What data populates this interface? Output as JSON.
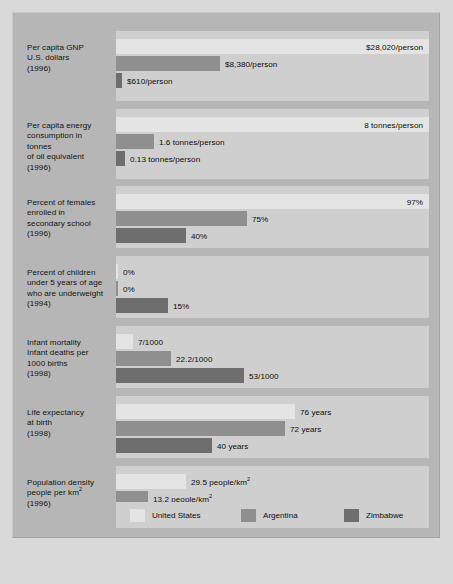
{
  "figure": {
    "bar_area_px": 313,
    "colors": {
      "united_states": "#e4e4e4",
      "argentina": "#8f8f8f",
      "zimbabwe": "#6e6e6e",
      "panel": "#cfcfcf",
      "frame": "#b6b6b6",
      "page": "#d9d9d9"
    }
  },
  "legend": {
    "items": [
      {
        "label": "United States",
        "key": "us",
        "color": "#e4e4e4",
        "left": 14
      },
      {
        "label": "Argentina",
        "key": "ar",
        "color": "#8f8f8f",
        "left": 125
      },
      {
        "label": "Zimbabwe",
        "key": "zw",
        "color": "#6e6e6e",
        "left": 228
      }
    ]
  },
  "chart_data": {
    "type": "bar",
    "orientation": "horizontal",
    "xlabel": "",
    "ylabel": "",
    "grid": false,
    "legend_position": "bottom",
    "series": [
      {
        "name": "United States",
        "color": "#e4e4e4"
      },
      {
        "name": "Argentina",
        "color": "#8f8f8f"
      },
      {
        "name": "Zimbabwe",
        "color": "#6e6e6e"
      }
    ],
    "groups": [
      {
        "id": "gnp",
        "label_lines": [
          "Per capita GNP",
          "U.S. dollars",
          "(1996)"
        ],
        "unit": "US dollars per person",
        "year": 1996,
        "bars": [
          {
            "series": "United States",
            "value": 28020,
            "display": "$28,020/person",
            "bar_px": 313,
            "label_inside": true
          },
          {
            "series": "Argentina",
            "value": 8380,
            "display": "$8,380/person",
            "bar_px": 104,
            "label_inside": false
          },
          {
            "series": "Zimbabwe",
            "value": 610,
            "display": "$610/person",
            "bar_px": 6,
            "label_inside": false
          }
        ]
      },
      {
        "id": "energy",
        "label_lines": [
          "Per capita energy",
          "consumption in",
          "tonnes",
          "of oil equivalent",
          "(1996)"
        ],
        "unit": "tonnes of oil equivalent per person",
        "year": 1996,
        "bars": [
          {
            "series": "United States",
            "value": 8,
            "display": "8 tonnes/person",
            "bar_px": 313,
            "label_inside": true
          },
          {
            "series": "Argentina",
            "value": 1.6,
            "display": "1.6 tonnes/person",
            "bar_px": 38,
            "label_inside": false
          },
          {
            "series": "Zimbabwe",
            "value": 0.13,
            "display": "0.13 tonnes/person",
            "bar_px": 9,
            "label_inside": false
          }
        ]
      },
      {
        "id": "females-secondary",
        "label_lines": [
          "Percent of females",
          "enrolled in",
          "secondary school",
          "(1996)"
        ],
        "unit": "percent",
        "year": 1996,
        "bars": [
          {
            "series": "United States",
            "value": 97,
            "display": "97%",
            "bar_px": 313,
            "label_inside": true
          },
          {
            "series": "Argentina",
            "value": 75,
            "display": "75%",
            "bar_px": 131,
            "label_inside": false
          },
          {
            "series": "Zimbabwe",
            "value": 40,
            "display": "40%",
            "bar_px": 70,
            "label_inside": false
          }
        ]
      },
      {
        "id": "underweight-children",
        "label_lines": [
          "Percent of children",
          "under 5 years of age",
          "who are underweight",
          "(1994)"
        ],
        "unit": "percent",
        "year": 1994,
        "bars": [
          {
            "series": "United States",
            "value": 0,
            "display": "0%",
            "bar_px": 2,
            "label_inside": false
          },
          {
            "series": "Argentina",
            "value": 0,
            "display": "0%",
            "bar_px": 2,
            "label_inside": false
          },
          {
            "series": "Zimbabwe",
            "value": 15,
            "display": "15%",
            "bar_px": 52,
            "label_inside": false
          }
        ]
      },
      {
        "id": "infant-mortality",
        "label_lines": [
          "Infant mortality",
          "Infant deaths per",
          "1000 births",
          "(1998)"
        ],
        "unit": "deaths per 1000 births",
        "year": 1998,
        "bars": [
          {
            "series": "United States",
            "value": 7,
            "display": "7/1000",
            "bar_px": 17,
            "label_inside": false
          },
          {
            "series": "Argentina",
            "value": 22.2,
            "display": "22.2/1000",
            "bar_px": 55,
            "label_inside": false
          },
          {
            "series": "Zimbabwe",
            "value": 53,
            "display": "53/1000",
            "bar_px": 128,
            "label_inside": false
          }
        ]
      },
      {
        "id": "life-expectancy",
        "label_lines": [
          "Life expectancy",
          "at birth",
          "(1998)"
        ],
        "unit": "years",
        "year": 1998,
        "bars": [
          {
            "series": "United States",
            "value": 76,
            "display": "76 years",
            "bar_px": 179,
            "label_inside": false
          },
          {
            "series": "Argentina",
            "value": 72,
            "display": "72 years",
            "bar_px": 169,
            "label_inside": false
          },
          {
            "series": "Zimbabwe",
            "value": 40,
            "display": "40 years",
            "bar_px": 96,
            "label_inside": false
          }
        ]
      },
      {
        "id": "population-density",
        "label_lines": [
          "Population density",
          "people per km<sup>2</sup>",
          "(1996)"
        ],
        "unit": "people per square kilometre",
        "year": 1996,
        "bars": [
          {
            "series": "United States",
            "value": 29.5,
            "display": "29.5 people/km<sup>2</sup>",
            "bar_px": 70,
            "label_inside": false
          },
          {
            "series": "Argentina",
            "value": 13.2,
            "display": "13.2 people/km<sup>2</sup>",
            "bar_px": 32,
            "label_inside": false
          },
          {
            "series": "Zimbabwe",
            "value": 28.4,
            "display": "28.4 people/km<sup>2</sup>",
            "bar_px": 68,
            "label_inside": false
          }
        ]
      }
    ]
  },
  "layout": {
    "group_tops": [
      18,
      96,
      173,
      243,
      313,
      383,
      453
    ],
    "group_heights": [
      70,
      70,
      62,
      62,
      62,
      62,
      62
    ],
    "label_tops": [
      30,
      108,
      185,
      255,
      325,
      395,
      465
    ],
    "bar_row_offsets": [
      8,
      25,
      42
    ],
    "bar_height": 15
  }
}
